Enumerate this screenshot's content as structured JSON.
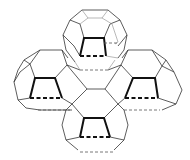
{
  "figure": {
    "cages": [
      {
        "id": "top",
        "position": "top"
      },
      {
        "id": "left",
        "position": "left"
      },
      {
        "id": "right",
        "position": "right"
      },
      {
        "id": "bottom",
        "position": "bottom"
      }
    ],
    "colors": {
      "background": "#ffffff",
      "line": "#111111"
    }
  }
}
